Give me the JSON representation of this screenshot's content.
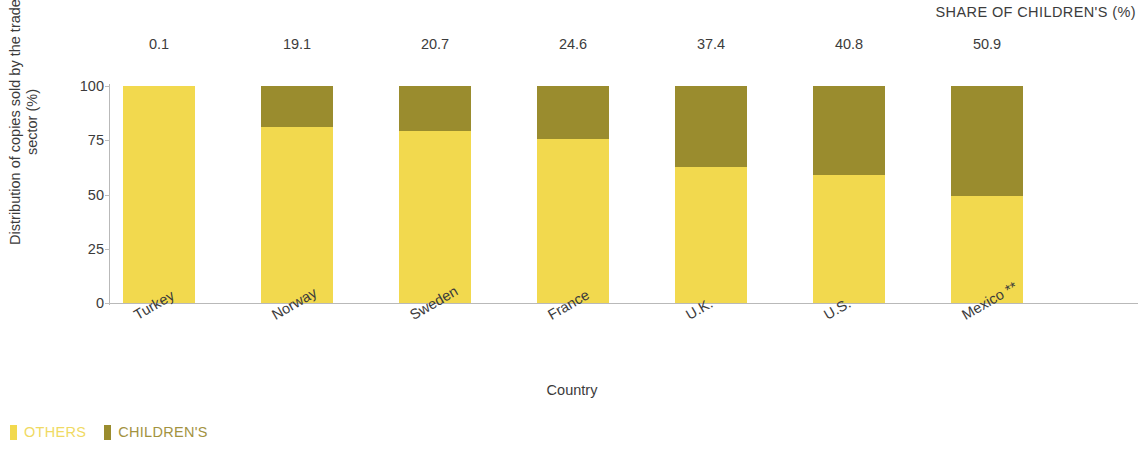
{
  "header": {
    "share_label": "SHARE OF CHILDREN'S (%)"
  },
  "axes": {
    "y_title": "Distribution of copies sold by the trade sector (%)",
    "x_title": "Country",
    "y_ticks": [
      "0",
      "25",
      "50",
      "75",
      "100"
    ]
  },
  "legend": {
    "items": [
      {
        "label": "OTHERS",
        "color": "#F2D94E",
        "text_color": "#F0DA63"
      },
      {
        "label": "CHILDREN'S",
        "color": "#9A8C2E",
        "text_color": "#A3933F"
      }
    ]
  },
  "chart_data": {
    "type": "bar",
    "title": "",
    "subtitle": "",
    "xlabel": "Country",
    "ylabel": "Distribution of copies sold by the trade sector (%)",
    "ylim": [
      0,
      100
    ],
    "yticks": [
      0,
      25,
      50,
      75,
      100
    ],
    "grid": false,
    "stacked": true,
    "legend_position": "bottom-left",
    "annotation_label": "SHARE OF CHILDREN'S (%)",
    "categories": [
      "Turkey",
      "Norway",
      "Sweden",
      "France",
      "U.K.",
      "U.S.",
      "Mexico **"
    ],
    "data_labels": [
      "0.1",
      "19.1",
      "20.7",
      "24.6",
      "37.4",
      "40.8",
      "50.9"
    ],
    "series": [
      {
        "name": "OTHERS",
        "color": "#F2D94E",
        "values": [
          99.9,
          80.9,
          79.3,
          75.4,
          62.6,
          59.2,
          49.1
        ]
      },
      {
        "name": "CHILDREN'S",
        "color": "#9A8C2E",
        "values": [
          0.1,
          19.1,
          20.7,
          24.6,
          37.4,
          40.8,
          50.9
        ]
      }
    ]
  }
}
